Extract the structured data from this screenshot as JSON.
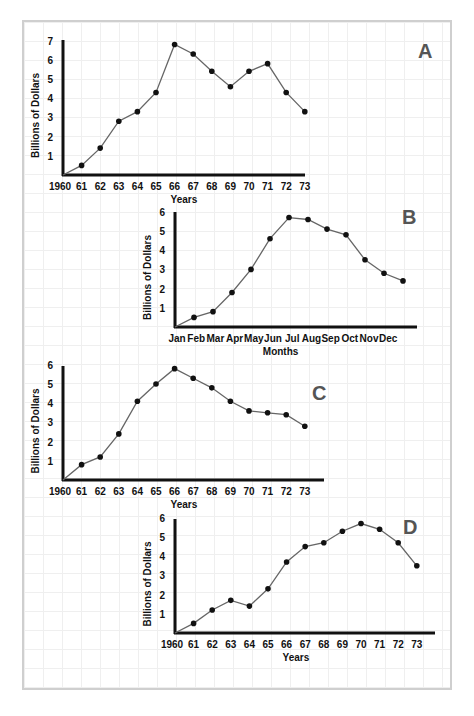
{
  "chart_data": [
    {
      "id": "A",
      "type": "line",
      "panel_label": "A",
      "title": "",
      "xlabel": "Years",
      "ylabel": "Billions of Dollars",
      "categories": [
        "1960",
        "61",
        "62",
        "63",
        "64",
        "65",
        "66",
        "67",
        "68",
        "69",
        "70",
        "71",
        "72",
        "73"
      ],
      "values": [
        0,
        0.5,
        1.4,
        2.8,
        3.3,
        4.3,
        6.8,
        6.3,
        5.4,
        4.6,
        5.4,
        5.8,
        4.3,
        3.3
      ],
      "yticks": [
        1,
        2,
        3,
        4,
        5,
        6,
        7
      ],
      "ylim": [
        0,
        7
      ],
      "grid": false,
      "legend": null
    },
    {
      "id": "B",
      "type": "line",
      "panel_label": "B",
      "title": "",
      "xlabel": "Months",
      "ylabel": "Billions of Dollars",
      "categories": [
        "Jan",
        "Feb",
        "Mar",
        "Apr",
        "May",
        "Jun",
        "Jul",
        "Aug",
        "Sep",
        "Oct",
        "Nov",
        "Dec"
      ],
      "values": [
        0,
        0.5,
        0.8,
        1.8,
        3.0,
        4.6,
        5.7,
        5.6,
        5.1,
        4.8,
        3.5,
        2.8,
        2.4
      ],
      "note": "13 data points plotted; points sit between month labels, final point beyond Dec",
      "yticks": [
        1,
        2,
        3,
        4,
        5,
        6
      ],
      "ylim": [
        0,
        6
      ],
      "grid": false,
      "legend": null
    },
    {
      "id": "C",
      "type": "line",
      "panel_label": "C",
      "title": "",
      "xlabel": "Years",
      "ylabel": "Billions of Dollars",
      "categories": [
        "1960",
        "61",
        "62",
        "63",
        "64",
        "65",
        "66",
        "67",
        "68",
        "69",
        "70",
        "71",
        "72",
        "73"
      ],
      "values": [
        0,
        0.8,
        1.2,
        2.4,
        4.1,
        5.0,
        5.8,
        5.3,
        4.8,
        4.1,
        3.6,
        3.5,
        3.4,
        2.8
      ],
      "yticks": [
        1,
        2,
        3,
        4,
        5,
        6
      ],
      "ylim": [
        0,
        6
      ],
      "grid": false,
      "legend": null
    },
    {
      "id": "D",
      "type": "line",
      "panel_label": "D",
      "title": "",
      "xlabel": "Years",
      "ylabel": "Billions of Dollars",
      "categories": [
        "1960",
        "61",
        "62",
        "63",
        "64",
        "65",
        "66",
        "67",
        "68",
        "69",
        "70",
        "71",
        "72",
        "73"
      ],
      "values": [
        0,
        0.5,
        1.2,
        1.7,
        1.4,
        2.3,
        3.7,
        4.5,
        4.7,
        5.3,
        5.7,
        5.4,
        4.7,
        3.5
      ],
      "yticks": [
        1,
        2,
        3,
        4,
        5,
        6
      ],
      "ylim": [
        0,
        6
      ],
      "grid": false,
      "legend": null
    }
  ],
  "layout": [
    {
      "x0": 63,
      "y0": 175,
      "xend": 305,
      "ytop": 40,
      "dx": 18.6,
      "dy": 19.2,
      "tick_dx": 18.6,
      "tick_x0": 63,
      "letter_x": 418,
      "letter_y": 58
    },
    {
      "x0": 175,
      "y0": 327,
      "xend": 417,
      "ytop": 212,
      "dx": 19.0,
      "dy": 19.2,
      "tick_dx": 19.2,
      "tick_x0": 177,
      "letter_x": 402,
      "letter_y": 224
    },
    {
      "x0": 63,
      "y0": 480,
      "xend": 324,
      "ytop": 366,
      "dx": 18.6,
      "dy": 19.2,
      "tick_dx": 18.6,
      "tick_x0": 63,
      "letter_x": 312,
      "letter_y": 400
    },
    {
      "x0": 175,
      "y0": 633,
      "xend": 435,
      "ytop": 519,
      "dx": 18.6,
      "dy": 19.2,
      "tick_dx": 18.6,
      "tick_x0": 175,
      "letter_x": 403,
      "letter_y": 534
    }
  ],
  "colors": {
    "axis": "#111111",
    "line": "#666666",
    "marker": "#111111",
    "panel_letter": "#555555",
    "frame": "#cfcfcf",
    "grid": "#efefef"
  }
}
